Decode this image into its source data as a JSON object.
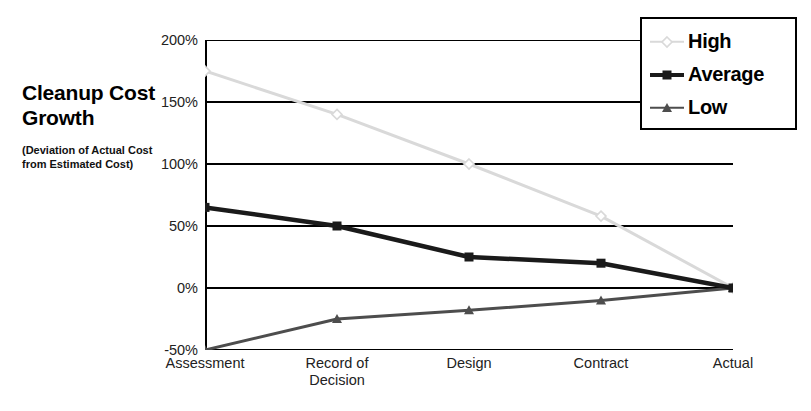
{
  "chart_data": {
    "type": "line",
    "title": "Cleanup Cost Growth",
    "subtitle": "(Deviation of Actual Cost from Estimated Cost)",
    "xlabel": "",
    "ylabel": "",
    "categories": [
      "Assessment",
      "Record of\nDecision",
      "Design",
      "Contract",
      "Actual"
    ],
    "ylim": [
      -50,
      200
    ],
    "yticks": [
      200,
      150,
      100,
      50,
      0,
      -50
    ],
    "ytick_labels": [
      "200%",
      "150%",
      "100%",
      "50%",
      "0%",
      "-50%"
    ],
    "grid": true,
    "legend_position": "top-right",
    "series": [
      {
        "name": "High",
        "color": "#d9d9d9",
        "marker": "diamond",
        "values": [
          175,
          140,
          100,
          58,
          0
        ]
      },
      {
        "name": "Average",
        "color": "#1a1a1a",
        "marker": "square",
        "values": [
          65,
          50,
          25,
          20,
          0
        ]
      },
      {
        "name": "Low",
        "color": "#4d4d4d",
        "marker": "triangle",
        "values": [
          -50,
          -25,
          -18,
          -10,
          0
        ]
      }
    ]
  },
  "legend": {
    "items": [
      {
        "label": "High"
      },
      {
        "label": "Average"
      },
      {
        "label": "Low"
      }
    ]
  }
}
